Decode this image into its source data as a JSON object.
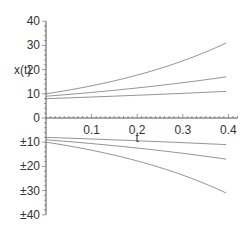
{
  "chart_data": {
    "type": "line",
    "title": "",
    "xlabel": "t",
    "ylabel": "x(t)",
    "xlim": [
      0,
      0.42
    ],
    "ylim": [
      -40,
      40
    ],
    "grid": false,
    "legend": null,
    "x_ticks": [
      "0.1",
      "0.2",
      "0.3",
      "0.4"
    ],
    "y_ticks": [
      "40",
      "30",
      "20",
      "10",
      "0",
      "±10",
      "±20",
      "±30",
      "±40"
    ],
    "x": [
      0,
      0.05,
      0.1,
      0.15,
      0.2,
      0.25,
      0.3,
      0.35,
      0.395
    ],
    "series": [
      {
        "name": "curve-1",
        "values": [
          10,
          11.5,
          13.3,
          15.4,
          17.8,
          20.6,
          23.8,
          27.5,
          31
        ]
      },
      {
        "name": "curve-2",
        "values": [
          9,
          9.7,
          10.5,
          11.4,
          12.4,
          13.4,
          14.6,
          15.8,
          17
        ]
      },
      {
        "name": "curve-3",
        "values": [
          8,
          8.3,
          8.7,
          9.0,
          9.4,
          9.8,
          10.2,
          10.6,
          11
        ]
      },
      {
        "name": "curve-4",
        "values": [
          -8,
          -8.3,
          -8.7,
          -9.0,
          -9.4,
          -9.8,
          -10.2,
          -10.6,
          -11
        ]
      },
      {
        "name": "curve-5",
        "values": [
          -9,
          -9.7,
          -10.5,
          -11.4,
          -12.4,
          -13.4,
          -14.6,
          -15.8,
          -17
        ]
      },
      {
        "name": "curve-6",
        "values": [
          -10,
          -11.5,
          -13.3,
          -15.4,
          -17.8,
          -20.6,
          -23.8,
          -27.5,
          -31
        ]
      }
    ],
    "colors": {
      "axis": "#555555",
      "curve": "#888888"
    }
  }
}
